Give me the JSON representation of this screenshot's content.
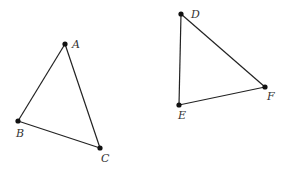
{
  "diagram": {
    "triangles": [
      {
        "name": "ABC",
        "vertices": [
          {
            "label": "A",
            "x": 65,
            "y": 44,
            "lx": 72,
            "ly": 48
          },
          {
            "label": "B",
            "x": 18,
            "y": 121,
            "lx": 16,
            "ly": 137
          },
          {
            "label": "C",
            "x": 100,
            "y": 148,
            "lx": 101,
            "ly": 162
          }
        ]
      },
      {
        "name": "DEF",
        "vertices": [
          {
            "label": "D",
            "x": 181,
            "y": 14,
            "lx": 191,
            "ly": 18
          },
          {
            "label": "E",
            "x": 179,
            "y": 105,
            "lx": 178,
            "ly": 119
          },
          {
            "label": "F",
            "x": 265,
            "y": 87,
            "lx": 267,
            "ly": 100
          }
        ]
      }
    ]
  }
}
